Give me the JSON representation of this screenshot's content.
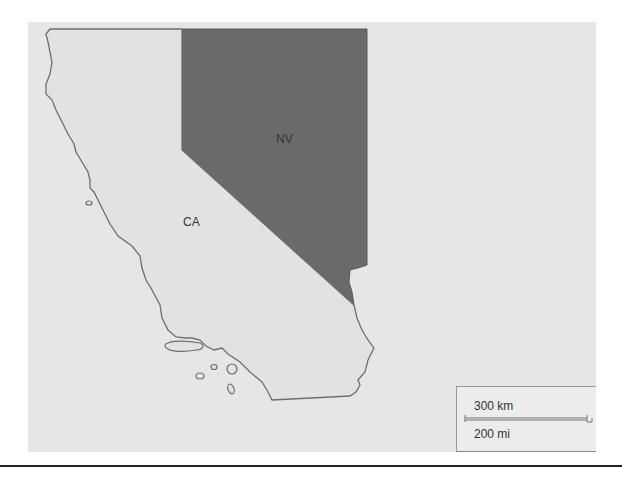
{
  "map": {
    "background_color": "#e6e6e6",
    "states": [
      {
        "id": "CA",
        "label": "CA",
        "fill": "#e2e2e2",
        "stroke": "#6e6e6e"
      },
      {
        "id": "NV",
        "label": "NV",
        "fill": "#6a6a6a",
        "stroke": "#5a5a5a"
      }
    ],
    "scale_bar": {
      "metric_label": "300 km",
      "imperial_label": "200 mi"
    }
  }
}
